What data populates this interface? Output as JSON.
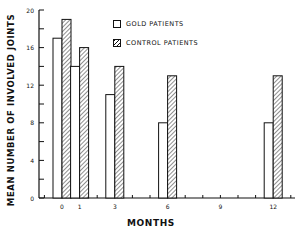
{
  "chart_data": {
    "type": "bar",
    "title": "",
    "xlabel": "MONTHS",
    "ylabel": "MEAN NUMBER OF INVOLVED JOINTS",
    "ylim": [
      0,
      20
    ],
    "yticks_labeled": [
      0,
      4,
      8,
      12,
      16,
      20
    ],
    "xticks": [
      0,
      1,
      3,
      6,
      9,
      12
    ],
    "categories": [
      "0",
      "1",
      "3",
      "6",
      "12"
    ],
    "series": [
      {
        "name": "GOLD PATIENTS",
        "fill": "open",
        "values": [
          17,
          14,
          11,
          8,
          8
        ]
      },
      {
        "name": "CONTROL PATIENTS",
        "fill": "hatched",
        "values": [
          19,
          16,
          14,
          13,
          13
        ]
      }
    ],
    "legend_position": "top-center",
    "grid": false
  },
  "axes": {
    "ylabel": "MEAN NUMBER OF INVOLVED JOINTS",
    "xlabel": "MONTHS"
  },
  "legend": {
    "gold": "GOLD PATIENTS",
    "control": "CONTROL PATIENTS"
  }
}
